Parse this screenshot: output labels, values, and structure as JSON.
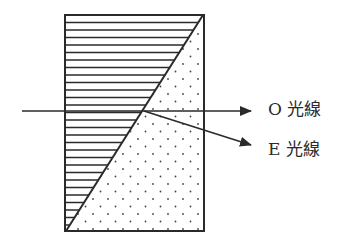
{
  "diagram": {
    "type": "polarizing-prism",
    "labels": {
      "o_ray": "O 光線",
      "e_ray": "E 光線"
    },
    "colors": {
      "line": "#2a2a2a",
      "background": "#ffffff"
    },
    "regions": [
      {
        "name": "upper-left-crystal",
        "pattern": "horizontal-hatching"
      },
      {
        "name": "lower-right-crystal",
        "pattern": "dots"
      }
    ],
    "rays": [
      {
        "name": "incident-ray"
      },
      {
        "name": "o-ray",
        "label_ref": "o_ray"
      },
      {
        "name": "e-ray",
        "label_ref": "e_ray"
      }
    ]
  }
}
